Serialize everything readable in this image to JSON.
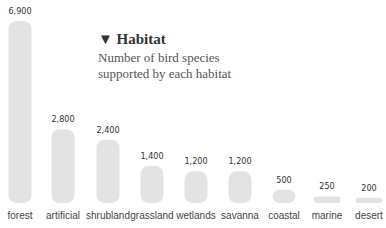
{
  "chart_data": {
    "type": "bar",
    "title": "▼ Habitat",
    "subtitle": "Number of bird species supported by each habitat",
    "xlabel": "",
    "ylabel": "",
    "ylim": [
      0,
      6900
    ],
    "grid": false,
    "categories": [
      "forest",
      "artificial",
      "shrubland",
      "grassland",
      "wetlands",
      "savanna",
      "coastal",
      "marine",
      "desert"
    ],
    "values": [
      6900,
      2800,
      2400,
      1400,
      1200,
      1200,
      500,
      250,
      200
    ],
    "value_labels": [
      "6,900",
      "2,800",
      "2,400",
      "1,400",
      "1,200",
      "1,200",
      "500",
      "250",
      "200"
    ],
    "bar_color": "#e3e3e3"
  }
}
